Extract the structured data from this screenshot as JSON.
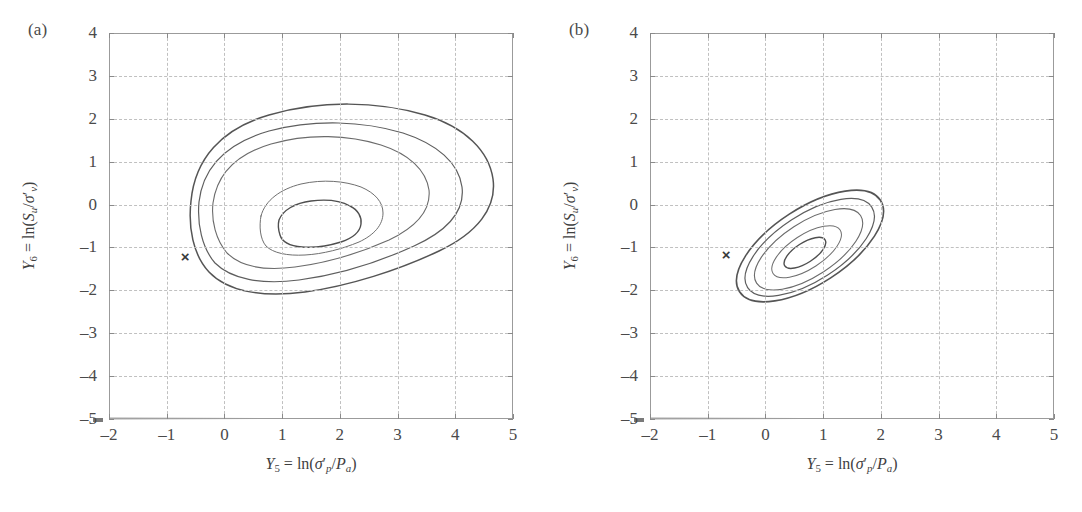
{
  "figure": {
    "panels": [
      {
        "label": "(a)",
        "name": "panel-a",
        "marker": {
          "glyph": "×",
          "x": -0.68,
          "y": -1.2
        },
        "chart_data": {
          "type": "line",
          "plot_kind": "contour",
          "title": "(a)",
          "xlabel": "Y5 = ln(σ'p/Pa)",
          "ylabel": "Y6 = ln(Su/σ'v)",
          "xlim": [
            -2,
            5
          ],
          "ylim": [
            -5,
            4
          ],
          "xticks": [
            -2,
            -1,
            0,
            1,
            2,
            3,
            4,
            5
          ],
          "yticks": [
            4,
            3,
            2,
            1,
            0,
            -1,
            -2,
            -3,
            -4,
            -5
          ],
          "grid": true,
          "legend": "none",
          "mode_point": [
            0.75,
            -1.0
          ],
          "contour_levels": 5,
          "contours": [
            {
              "level": 1,
              "note": "outermost, egg-shaped, widest",
              "x_range": [
                -1.25,
                4.02
              ],
              "y_range": [
                -2.9,
                1.57
              ]
            },
            {
              "level": 2,
              "x_range": [
                -1.1,
                3.45
              ],
              "y_range": [
                -2.5,
                1.02
              ]
            },
            {
              "level": 3,
              "x_range": [
                -0.85,
                2.85
              ],
              "y_range": [
                -2.25,
                0.72
              ]
            },
            {
              "level": 4,
              "x_range": [
                0.0,
                1.85
              ],
              "y_range": [
                -1.62,
                -0.32
              ]
            },
            {
              "level": 5,
              "note": "innermost",
              "x_range": [
                0.3,
                1.25
              ],
              "y_range": [
                -1.32,
                -0.72
              ]
            }
          ]
        }
      },
      {
        "label": "(b)",
        "name": "panel-b",
        "marker": {
          "glyph": "×",
          "x": -0.68,
          "y": -1.15
        },
        "chart_data": {
          "type": "line",
          "plot_kind": "contour",
          "title": "(b)",
          "xlabel": "Y5 = ln(σ'p/Pa)",
          "ylabel": "Y6 = ln(Su/σ'v)",
          "xlim": [
            -2,
            5
          ],
          "ylim": [
            -5,
            4
          ],
          "xticks": [
            -2,
            -1,
            0,
            1,
            2,
            3,
            4,
            5
          ],
          "yticks": [
            4,
            3,
            2,
            1,
            0,
            -1,
            -2,
            -3,
            -4,
            -5
          ],
          "grid": true,
          "legend": "none",
          "mode_point": [
            -0.2,
            -0.95
          ],
          "tilt_degrees": -33,
          "contour_levels": 5,
          "contours": [
            {
              "level": 1,
              "note": "outermost tilted ellipse",
              "x_range": [
                -1.05,
                1.3
              ],
              "y_range": [
                -2.1,
                0.42
              ]
            },
            {
              "level": 2,
              "x_range": [
                -0.93,
                1.12
              ],
              "y_range": [
                -1.95,
                0.25
              ]
            },
            {
              "level": 3,
              "x_range": [
                -0.82,
                0.88
              ],
              "y_range": [
                -1.8,
                0.08
              ]
            },
            {
              "level": 4,
              "x_range": [
                -0.6,
                0.35
              ],
              "y_range": [
                -1.5,
                -0.35
              ]
            },
            {
              "level": 5,
              "note": "innermost",
              "x_range": [
                -0.45,
                0.12
              ],
              "y_range": [
                -1.25,
                -0.68
              ]
            }
          ]
        }
      }
    ],
    "axis": {
      "x_title_parts": {
        "y": "Y",
        "y_sub": "5",
        "eq": " = ln(",
        "sigma": "σ",
        "prime": "′",
        "p_sub": "p",
        "slash": "/",
        "P": "P",
        "a_sub": "a",
        "close": ")"
      },
      "y_title_parts": {
        "y": "Y",
        "y_sub": "6",
        "eq": " = ln(",
        "S": "S",
        "u_sub": "u",
        "slash": "/",
        "sigma": "σ",
        "prime": "′",
        "v_sub": "v",
        "close": ")"
      },
      "xticklabels": [
        "–2",
        "–1",
        "0",
        "1",
        "2",
        "3",
        "4",
        "5"
      ],
      "yticklabels": [
        "4",
        "3",
        "2",
        "1",
        "0",
        "–1",
        "–2",
        "–3",
        "–4",
        "–5"
      ]
    },
    "colors": {
      "frame": "#9b9b9b",
      "grid": "#c0c0c0",
      "contour_outer": "#555555",
      "contour_inner": "#6f6f6f",
      "text": "#3f3f3f"
    }
  }
}
